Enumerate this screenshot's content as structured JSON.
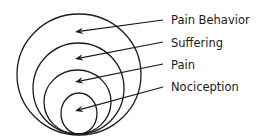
{
  "diagram": {
    "type": "nested-circles",
    "stroke_color": "#1a1a1a",
    "background": "#ffffff",
    "layers": [
      {
        "label": "Pain Behavior",
        "cx": 79,
        "cy": 74.5,
        "rx": 62,
        "ry": 60.5,
        "arrow_tip": [
          75,
          32
        ],
        "arrow_tail": [
          163,
          20
        ],
        "label_x": 171,
        "label_y": 24
      },
      {
        "label": "Suffering",
        "cx": 78.5,
        "cy": 88.5,
        "rx": 45.5,
        "ry": 45.5,
        "arrow_tip": [
          75,
          59
        ],
        "arrow_tail": [
          163,
          42
        ],
        "label_x": 171,
        "label_y": 47
      },
      {
        "label": "Pain",
        "cx": 77.5,
        "cy": 102,
        "rx": 33.5,
        "ry": 32,
        "arrow_tip": [
          75,
          82
        ],
        "arrow_tail": [
          163,
          64
        ],
        "label_x": 171,
        "label_y": 69
      },
      {
        "label": "Nociception",
        "cx": 79,
        "cy": 113.5,
        "rx": 18,
        "ry": 20.5,
        "arrow_tip": [
          75,
          111
        ],
        "arrow_tail": [
          163,
          87
        ],
        "label_x": 171,
        "label_y": 91
      }
    ]
  }
}
